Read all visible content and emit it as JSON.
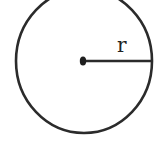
{
  "diagram": {
    "radius_label": "r",
    "stroke_color": "#2b2b2b",
    "background": "#ffffff"
  }
}
